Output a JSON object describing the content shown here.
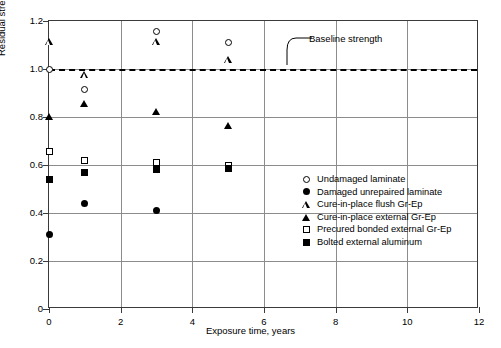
{
  "chart_data": {
    "type": "scatter",
    "title": "",
    "xlabel": "Exposure time, years",
    "ylabel": "Residual strength / Baseline strength",
    "xlim": [
      0,
      12
    ],
    "ylim": [
      0,
      1.2
    ],
    "xticks": [
      "0",
      "2",
      "4",
      "6",
      "8",
      "10",
      "12"
    ],
    "xtick_values": [
      0,
      2,
      4,
      6,
      8,
      10,
      12
    ],
    "yticks": [
      "0",
      "0.2",
      "0.4",
      "0.6",
      "0.8",
      "1.0",
      "1.2"
    ],
    "ytick_values": [
      0,
      0.2,
      0.4,
      0.6,
      0.8,
      1.0,
      1.2
    ],
    "grid": true,
    "legend_position": "center-right",
    "annotations": [
      {
        "text": "Baseline strength",
        "x": 7.1,
        "y": 1.085,
        "points_to_y": 1.0
      }
    ],
    "reference_lines": [
      {
        "name": "baseline-strength-line",
        "orientation": "horizontal",
        "value": 1.0,
        "style": "dashed",
        "color": "#000000"
      }
    ],
    "series": [
      {
        "name": "Undamaged laminate",
        "marker": "open-circle",
        "color": "#000000",
        "points": [
          {
            "x": 0,
            "y": 1.0
          },
          {
            "x": 1,
            "y": 0.915
          },
          {
            "x": 3,
            "y": 1.155
          },
          {
            "x": 5,
            "y": 1.11
          }
        ]
      },
      {
        "name": "Damaged unrepaired laminate",
        "marker": "filled-circle",
        "color": "#000000",
        "points": [
          {
            "x": 0,
            "y": 0.31
          },
          {
            "x": 1,
            "y": 0.44
          },
          {
            "x": 3,
            "y": 0.41
          }
        ]
      },
      {
        "name": "Cure-in-place flush Gr-Ep",
        "marker": "open-triangle",
        "color": "#000000",
        "points": [
          {
            "x": 0,
            "y": 1.115
          },
          {
            "x": 1,
            "y": 0.975
          },
          {
            "x": 3,
            "y": 1.115
          },
          {
            "x": 5,
            "y": 1.04
          }
        ]
      },
      {
        "name": "Cure-in-place external Gr-Ep",
        "marker": "filled-triangle",
        "color": "#000000",
        "points": [
          {
            "x": 0,
            "y": 0.8
          },
          {
            "x": 1,
            "y": 0.855
          },
          {
            "x": 3,
            "y": 0.82
          },
          {
            "x": 5,
            "y": 0.765
          }
        ]
      },
      {
        "name": "Precured bonded external Gr-Ep",
        "marker": "open-square",
        "color": "#000000",
        "points": [
          {
            "x": 0,
            "y": 0.655
          },
          {
            "x": 1,
            "y": 0.62
          },
          {
            "x": 3,
            "y": 0.61
          },
          {
            "x": 5,
            "y": 0.6
          }
        ]
      },
      {
        "name": "Bolted external aluminum",
        "marker": "filled-square",
        "color": "#000000",
        "points": [
          {
            "x": 0,
            "y": 0.54
          },
          {
            "x": 1,
            "y": 0.57
          },
          {
            "x": 3,
            "y": 0.58
          },
          {
            "x": 5,
            "y": 0.585
          }
        ]
      }
    ]
  }
}
